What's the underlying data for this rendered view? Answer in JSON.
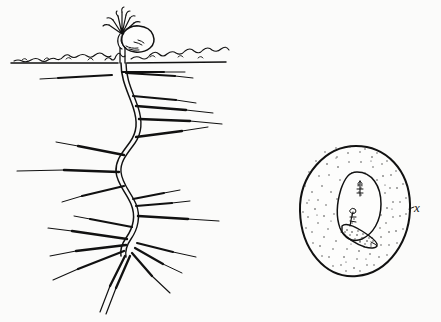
{
  "figure": {
    "kind": "botanical-line-drawing",
    "title_visible": false,
    "background_color": "#fbfbfa",
    "ink_color": "#111111",
    "panels": [
      {
        "name": "seedling-with-root-system",
        "description_visible": false,
        "elements": [
          "soil-line",
          "emerging-shoot",
          "seed-coat-remnant",
          "taproot",
          "lateral-roots",
          "root-tip-fan"
        ]
      },
      {
        "name": "seed-cross-section",
        "label": "x",
        "elements": [
          "seed-coat-outline",
          "stippled-endosperm",
          "inner-cavity-outline",
          "plumule",
          "radicle",
          "embryo-mass"
        ]
      }
    ]
  },
  "labels": {
    "seed_section_label": "x"
  },
  "colors": {
    "ink": "#111111",
    "background": "#fbfbfa",
    "stipple": "#3a3a3a"
  }
}
